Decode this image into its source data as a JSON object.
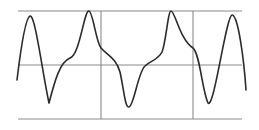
{
  "diagram": {
    "colors": {
      "background": "#ffffff",
      "grid": "#8a8a8a",
      "curve": "#2a2a2a"
    },
    "horizontal_lines": [
      {
        "name": "top-reference-line",
        "y": 11,
        "x1": 18,
        "x2": 242
      },
      {
        "name": "zero-axis-line",
        "y": 65,
        "x1": 18,
        "x2": 242
      },
      {
        "name": "bottom-reference-line",
        "y": 119,
        "x1": 18,
        "x2": 242
      }
    ],
    "vertical_lines": [
      {
        "name": "grid-line-1",
        "x": 101,
        "y1": 11,
        "y2": 119
      },
      {
        "name": "grid-line-2",
        "x": 193,
        "y1": 11,
        "y2": 119
      }
    ],
    "curve_path": "M17,80 C20,55 25,18 30,16 C35,14 42,70 49,103 C55,80 60,62 70,58 C80,55 84,10 89,11 C93,12 96,42 101,48 C108,56 116,58 120,72 C124,90 125,108 129,107 C134,106 138,72 145,66 C150,61 158,60 162,52 C166,42 168,11 171,11 C175,11 180,40 193,48 C200,54 202,90 208,103 C214,110 226,16 232,15 C238,14 244,60 246,90"
  }
}
